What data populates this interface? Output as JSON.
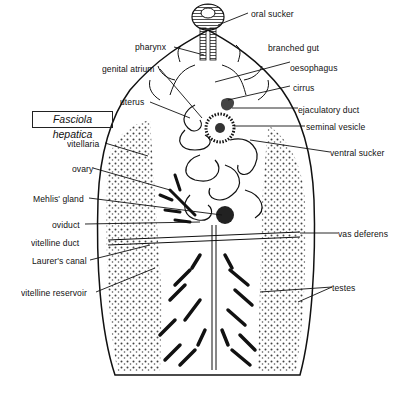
{
  "figure": {
    "title": "Fasciola hepatica",
    "labels": {
      "oral_sucker": "oral sucker",
      "pharynx": "pharynx",
      "branched_gut": "branched gut",
      "genital_atrium": "genital atrium",
      "oesophagus": "oesophagus",
      "cirrus": "cirrus",
      "uterus": "uterus",
      "ejaculatory_duct": "ejaculatory duct",
      "seminal_vesicle": "seminal vesicle",
      "vitellaria": "vitellaria",
      "ventral_sucker": "ventral sucker",
      "ovary": "ovary",
      "mehlis_gland": "Mehlis' gland",
      "oviduct": "oviduct",
      "vitelline_duct": "vitelline duct",
      "vas_deferens": "vas deferens",
      "laurers_canal": "Laurer's canal",
      "vitelline_reservoir": "vitelline reservoir",
      "testes": "testes"
    }
  }
}
